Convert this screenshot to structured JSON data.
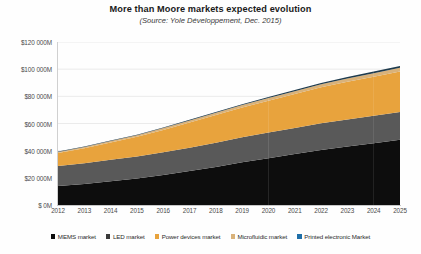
{
  "chart_data": {
    "type": "area",
    "stacked": true,
    "title": "More than Moore markets expected evolution",
    "subtitle": "(Source: Yole Développement, Dec. 2015)",
    "xlabel": "",
    "ylabel": "",
    "grid": true,
    "legend_position": "bottom",
    "categories": [
      "2012",
      "2013",
      "2014",
      "2015",
      "2016",
      "2017",
      "2018",
      "2019",
      "2020",
      "2021",
      "2022",
      "2023",
      "2024",
      "2025"
    ],
    "ylim": [
      0,
      120000
    ],
    "y_ticks": [
      0,
      20000,
      40000,
      60000,
      80000,
      100000,
      120000
    ],
    "y_tick_labels": [
      "$ 0M",
      "$20 000M",
      "$40 000M",
      "$60 000M",
      "$80 000M",
      "$100 000M",
      "$120 000M"
    ],
    "series": [
      {
        "name": "MEMS market",
        "color": "#0D0D0D",
        "values": [
          14000,
          15500,
          17500,
          19500,
          22000,
          25000,
          28000,
          31500,
          34500,
          37500,
          40500,
          43000,
          45500,
          48000
        ]
      },
      {
        "name": "LED market",
        "color": "#595959",
        "values": [
          14700,
          15200,
          15800,
          16200,
          16800,
          17200,
          17800,
          18300,
          18800,
          19200,
          19600,
          19900,
          20200,
          20500
        ]
      },
      {
        "name": "Power devices market",
        "color": "#E8A33D",
        "values": [
          9500,
          11000,
          12800,
          14500,
          16500,
          18500,
          20500,
          22000,
          23500,
          25000,
          26500,
          27800,
          28800,
          29800
        ]
      },
      {
        "name": "Microfluidic market",
        "color": "#D9B27A",
        "values": [
          900,
          1000,
          1100,
          1200,
          1350,
          1500,
          1650,
          1800,
          1950,
          2100,
          2250,
          2400,
          2550,
          2700
        ]
      },
      {
        "name": "Printed electronic Market",
        "color": "#1F3B4D",
        "values": [
          250,
          280,
          320,
          370,
          430,
          500,
          580,
          660,
          760,
          860,
          980,
          1100,
          1250,
          1400
        ]
      }
    ],
    "totals": [
      39350,
      42980,
      47520,
      51770,
      57080,
      62700,
      68530,
      74260,
      79510,
      84660,
      89830,
      94200,
      98300,
      102400
    ]
  },
  "legend": {
    "items": [
      {
        "label": "MEMS market",
        "color": "#0D0D0D"
      },
      {
        "label": "LED market",
        "color": "#3A3A3A"
      },
      {
        "label": "Power devices market",
        "color": "#E8A33D"
      },
      {
        "label": "Microfluidic market",
        "color": "#D9B27A"
      },
      {
        "label": "Printed electronic Market",
        "color": "#1F6FA8"
      }
    ]
  }
}
